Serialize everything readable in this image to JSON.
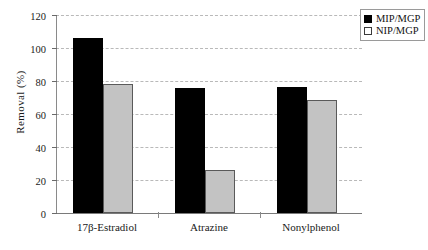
{
  "chart_data": {
    "type": "bar",
    "title": "",
    "xlabel": "",
    "ylabel": "Removal (%)",
    "ylim": [
      0,
      120
    ],
    "ytick_values": [
      0,
      20,
      40,
      60,
      80,
      100,
      120
    ],
    "ytick_labels": [
      "0",
      "20",
      "40",
      "60",
      "80",
      "100",
      "120"
    ],
    "grid": true,
    "legend_position": "top-right",
    "categories": [
      "17β-Estradiol",
      "Atrazine",
      "Nonylphenol"
    ],
    "series": [
      {
        "name": "MIP/MGP",
        "color": "#000000",
        "values": [
          106,
          75.5,
          76.5
        ]
      },
      {
        "name": "NIP/MGP",
        "color": "#c3c3c3",
        "values": [
          78,
          26,
          68.5
        ]
      }
    ]
  },
  "legend": {
    "entries": [
      {
        "label": "MIP/MGP",
        "swatch": "filled-black-square"
      },
      {
        "label": "NIP/MGP",
        "swatch": "outlined-white-square"
      }
    ]
  }
}
